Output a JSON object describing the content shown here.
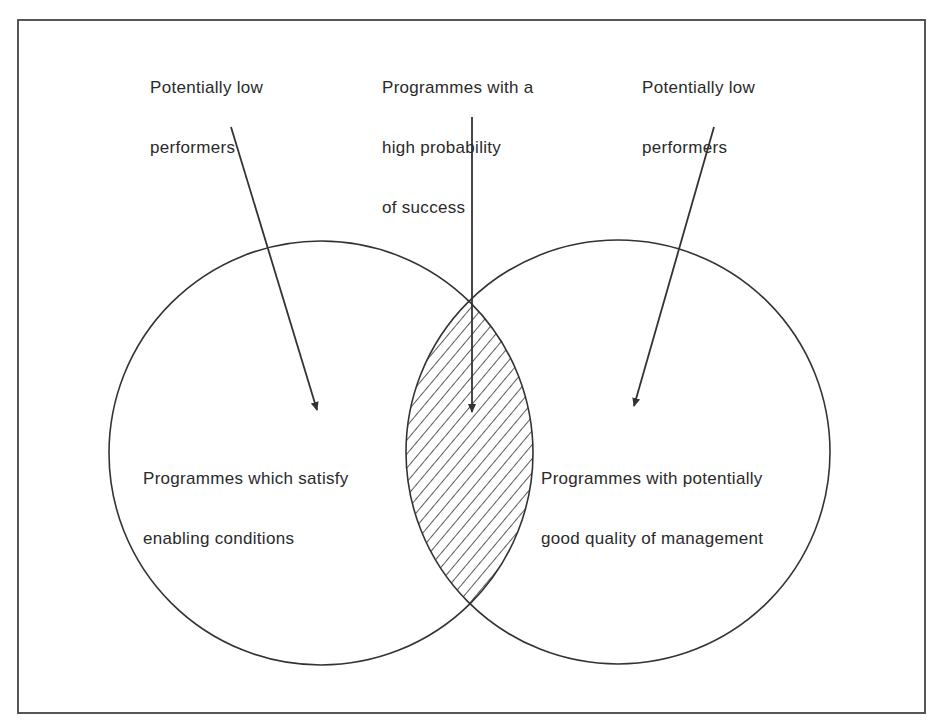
{
  "diagram": {
    "type": "venn",
    "sets": [
      {
        "id": "left",
        "label_line1": "Programmes which satisfy",
        "label_line2": "enabling conditions"
      },
      {
        "id": "right",
        "label_line1": "Programmes with potentially",
        "label_line2": "good quality of management"
      }
    ],
    "intersection": {
      "label_line1": "Programmes with a",
      "label_line2": "high probability",
      "label_line3": "of success",
      "fill": "hatched"
    },
    "callouts": [
      {
        "id": "left-only",
        "label_line1": "Potentially low",
        "label_line2": "performers",
        "points_to": "left"
      },
      {
        "id": "right-only",
        "label_line1": "Potentially low",
        "label_line2": "performers",
        "points_to": "right"
      }
    ],
    "colors": {
      "stroke": "#333333",
      "background": "#ffffff",
      "text": "#2a2a2a"
    }
  }
}
